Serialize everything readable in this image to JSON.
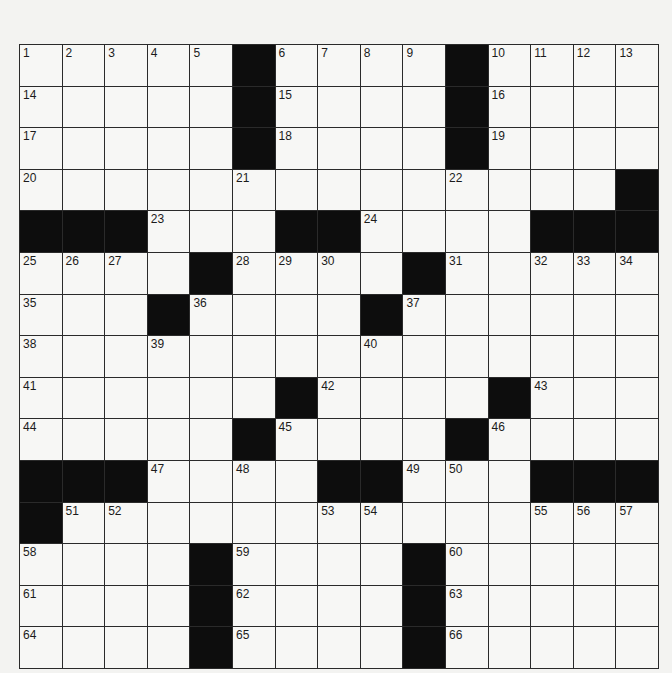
{
  "puzzle": {
    "rows": 15,
    "cols": 15,
    "colors": {
      "cell": "#f7f7f5",
      "block": "#0d0d0d",
      "line": "#2a2a2a",
      "paper": "#f3f3f1"
    },
    "grid": [
      [
        "1",
        "2",
        "3",
        "4",
        "5",
        "#",
        "6",
        "7",
        "8",
        "9",
        "#",
        "10",
        "11",
        "12",
        "13"
      ],
      [
        "14",
        ".",
        ".",
        ".",
        ".",
        "#",
        "15",
        ".",
        ".",
        ".",
        "#",
        "16",
        ".",
        ".",
        "."
      ],
      [
        "17",
        ".",
        ".",
        ".",
        ".",
        "#",
        "18",
        ".",
        ".",
        ".",
        "#",
        "19",
        ".",
        ".",
        "."
      ],
      [
        "20",
        ".",
        ".",
        ".",
        ".",
        "21",
        ".",
        ".",
        ".",
        ".",
        "22",
        ".",
        ".",
        ".",
        "#"
      ],
      [
        "#",
        "#",
        "#",
        "23",
        ".",
        ".",
        "#",
        "#",
        "24",
        ".",
        ".",
        ".",
        "#",
        "#",
        "#"
      ],
      [
        "25",
        "26",
        "27",
        ".",
        "#",
        "28",
        "29",
        "30",
        ".",
        "#",
        "31",
        ".",
        "32",
        "33",
        "34"
      ],
      [
        "35",
        ".",
        ".",
        "#",
        "36",
        ".",
        ".",
        ".",
        "#",
        "37",
        ".",
        ".",
        ".",
        ".",
        "."
      ],
      [
        "38",
        ".",
        ".",
        "39",
        ".",
        ".",
        ".",
        ".",
        "40",
        ".",
        ".",
        ".",
        ".",
        ".",
        "."
      ],
      [
        "41",
        ".",
        ".",
        ".",
        ".",
        ".",
        "#",
        "42",
        ".",
        ".",
        ".",
        "#",
        "43",
        ".",
        "."
      ],
      [
        "44",
        ".",
        ".",
        ".",
        ".",
        "#",
        "45",
        ".",
        ".",
        ".",
        "#",
        "46",
        ".",
        ".",
        "."
      ],
      [
        "#",
        "#",
        "#",
        "47",
        ".",
        "48",
        ".",
        "#",
        "#",
        "49",
        "50",
        ".",
        "#",
        "#",
        "#"
      ],
      [
        "#",
        "51",
        "52",
        ".",
        ".",
        ".",
        ".",
        "53",
        "54",
        ".",
        ".",
        ".",
        "55",
        "56",
        "57"
      ],
      [
        "58",
        ".",
        ".",
        ".",
        "#",
        "59",
        ".",
        ".",
        ".",
        "#",
        "60",
        ".",
        ".",
        ".",
        "."
      ],
      [
        "61",
        ".",
        ".",
        ".",
        "#",
        "62",
        ".",
        ".",
        ".",
        "#",
        "63",
        ".",
        ".",
        ".",
        "."
      ],
      [
        "64",
        ".",
        ".",
        ".",
        "#",
        "65",
        ".",
        ".",
        ".",
        "#",
        "66",
        ".",
        ".",
        ".",
        "."
      ]
    ]
  }
}
